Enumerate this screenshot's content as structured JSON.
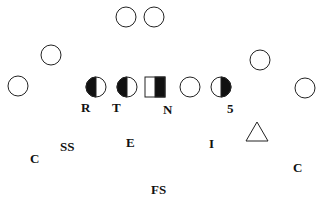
{
  "diagram": {
    "offense": [
      {
        "id": "qb1",
        "shape": "circle",
        "fill": "none",
        "cx": 126,
        "cy": 17
      },
      {
        "id": "qb2",
        "shape": "circle",
        "fill": "none",
        "cx": 154,
        "cy": 17
      },
      {
        "id": "wing-left",
        "shape": "circle",
        "fill": "none",
        "cx": 51,
        "cy": 55
      },
      {
        "id": "wing-right",
        "shape": "circle",
        "fill": "none",
        "cx": 260,
        "cy": 60
      },
      {
        "id": "wide-left",
        "shape": "circle",
        "fill": "none",
        "cx": 18,
        "cy": 86
      },
      {
        "id": "wide-right",
        "shape": "circle",
        "fill": "none",
        "cx": 305,
        "cy": 88
      },
      {
        "id": "lineman-1",
        "shape": "circle",
        "fill": "left-half",
        "cx": 96,
        "cy": 87
      },
      {
        "id": "lineman-2",
        "shape": "circle",
        "fill": "left-half",
        "cx": 127,
        "cy": 87
      },
      {
        "id": "center",
        "shape": "square",
        "fill": "right-half",
        "cx": 155,
        "cy": 87
      },
      {
        "id": "lineman-4",
        "shape": "circle",
        "fill": "none",
        "cx": 190,
        "cy": 87
      },
      {
        "id": "lineman-5",
        "shape": "circle",
        "fill": "right-half",
        "cx": 221,
        "cy": 87
      }
    ],
    "defense_marker": {
      "shape": "triangle",
      "cx": 257,
      "cy": 132
    },
    "labels": [
      {
        "text": "R",
        "x": 82,
        "y": 101
      },
      {
        "text": "T",
        "x": 113,
        "y": 101
      },
      {
        "text": "N",
        "x": 164,
        "y": 103
      },
      {
        "text": "5",
        "x": 227,
        "y": 102
      },
      {
        "text": "SS",
        "x": 60,
        "y": 141
      },
      {
        "text": "E",
        "x": 126,
        "y": 136
      },
      {
        "text": "I",
        "x": 209,
        "y": 137
      },
      {
        "text": "C",
        "x": 30,
        "y": 152
      },
      {
        "text": "C",
        "x": 292,
        "y": 161
      },
      {
        "text": "FS",
        "x": 151,
        "y": 183
      }
    ]
  }
}
